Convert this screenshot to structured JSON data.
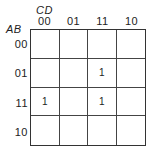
{
  "kmap": {
    "col_variable": "CD",
    "row_variable": "AB",
    "col_headers": [
      "00",
      "01",
      "11",
      "10"
    ],
    "row_headers": [
      "00",
      "01",
      "11",
      "10"
    ],
    "cells": [
      [
        "",
        "",
        "",
        ""
      ],
      [
        "",
        "",
        "1",
        ""
      ],
      [
        "1",
        "",
        "1",
        ""
      ],
      [
        "",
        "",
        "",
        ""
      ]
    ]
  }
}
